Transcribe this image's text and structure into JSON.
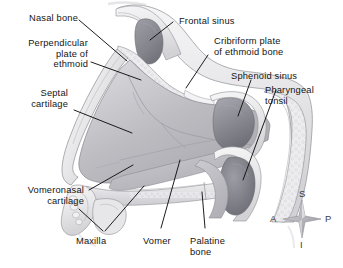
{
  "figure": {
    "background_color": "#ffffff",
    "text_color": "#141414",
    "width": 343,
    "height": 268
  },
  "labels": {
    "nasal_bone": "Nasal bone",
    "perpendicular_plate": "Perpendicular\nplate of\nethmoid",
    "septal_cartilage": "Septal\ncartilage",
    "vomeronasal_cartilage": "Vomeronasal\ncartilage",
    "maxilla": "Maxilla",
    "vomer": "Vomer",
    "palatine_bone": "Palatine\nbone",
    "frontal_sinus": "Frontal sinus",
    "cribriform_plate": "Cribriform plate\nof ethmoid bone",
    "sphenoid_sinus": "Sphenoid sinus",
    "pharyngeal_tonsil": "Pharyngeal\ntonsil"
  },
  "compass": {
    "superior": "S",
    "inferior": "I",
    "anterior": "A",
    "posterior": "P"
  },
  "palette": {
    "ink": "#141414",
    "leader_line": "#111111",
    "septum_fill": "#b9b9bd",
    "septum_fill_light": "#cfcfd3",
    "bone_fill": "#efeff0",
    "sinus_dark": "#8b8b93",
    "sinus_darker": "#77777f",
    "outline": "#6e6e74",
    "compass": "#9a9aa0"
  }
}
